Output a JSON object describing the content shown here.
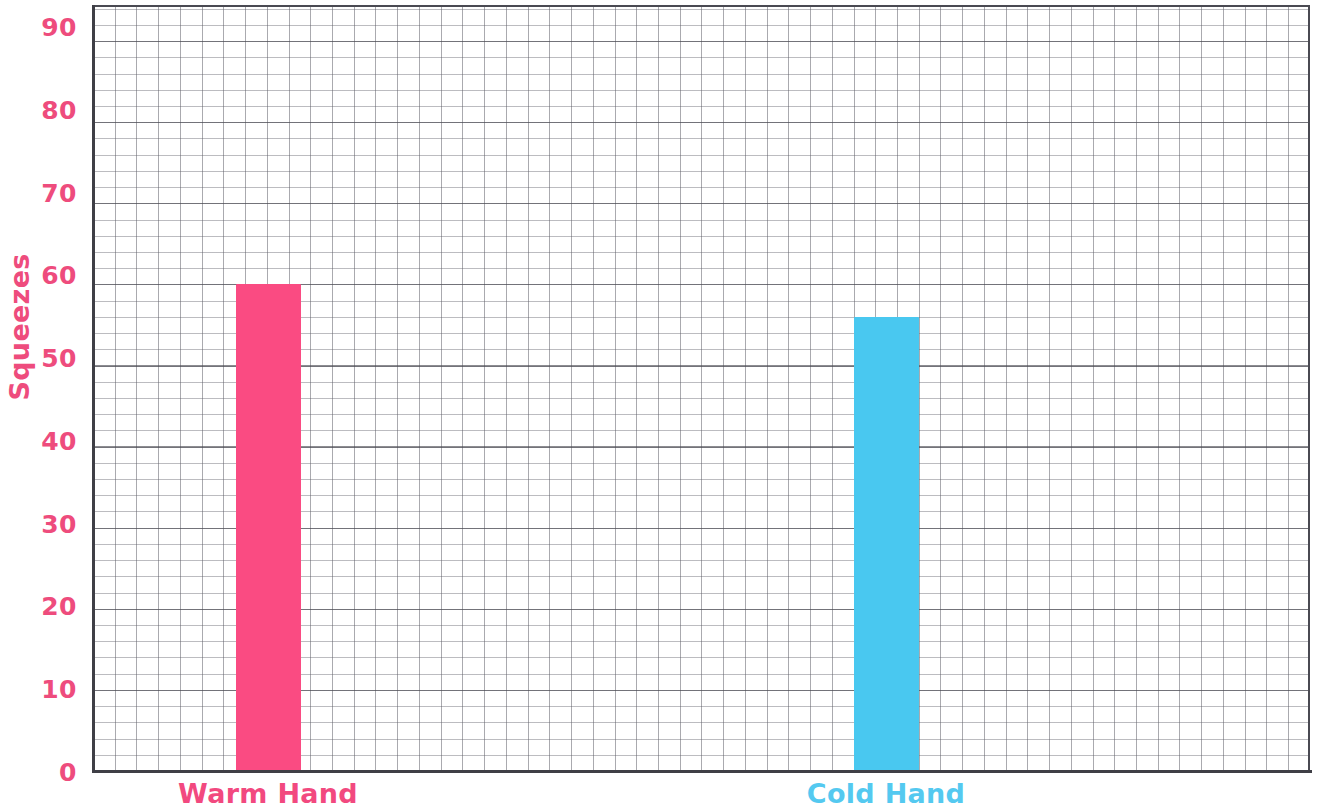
{
  "chart_data": {
    "type": "bar",
    "title": "",
    "subtitle": "",
    "xlabel": "",
    "ylabel": "Squeezes",
    "categories": [
      "Warm Hand",
      "Cold Hand"
    ],
    "values": [
      59,
      55
    ],
    "series": [
      {
        "name": "Squeezes",
        "values": [
          59,
          55
        ]
      }
    ],
    "bar_colors": [
      "#fa4b82",
      "#49c8f0"
    ],
    "category_label_colors": [
      "#f2497f",
      "#54c9f0"
    ],
    "ylim": [
      0,
      90
    ],
    "y_ticks": [
      0,
      10,
      20,
      30,
      40,
      50,
      60,
      70,
      80,
      90
    ],
    "y_tick_labels": [
      "0",
      "10",
      "20",
      "30",
      "40",
      "50",
      "60",
      "70",
      "80",
      "90"
    ],
    "y_minor_step": 2,
    "grid": true,
    "grid_style": "graph-paper",
    "legend": false,
    "legend_position": "none",
    "axis_label_color": "#ee4c7d",
    "grid_color": "#5a5a64",
    "axis_color": "#3f3f46",
    "background": "#ffffff"
  },
  "axes": {
    "y_title": "Squeezes"
  }
}
